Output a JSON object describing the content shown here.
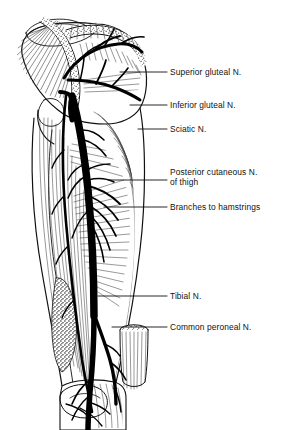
{
  "figure": {
    "view": "posterior",
    "background_color": "#ffffff",
    "ink_color": "#111111",
    "nerve_color": "#000000"
  },
  "labels": [
    {
      "id": "superior-gluteal",
      "text": "Superior gluteal N.",
      "line1": "Superior gluteal N.",
      "line2": "",
      "text_x": 170,
      "text_y": 72,
      "leader_x1": 152,
      "leader_x2": 167,
      "leader_y": 72,
      "anchor_x": 118,
      "anchor_y": 64
    },
    {
      "id": "inferior-gluteal",
      "text": "Inferior gluteal N.",
      "line1": "Inferior gluteal N.",
      "line2": "",
      "text_x": 170,
      "text_y": 105,
      "leader_x1": 152,
      "leader_x2": 167,
      "leader_y": 105,
      "anchor_x": 110,
      "anchor_y": 96
    },
    {
      "id": "sciatic",
      "text": "Sciatic N.",
      "line1": "Sciatic N.",
      "line2": "",
      "text_x": 170,
      "text_y": 129,
      "leader_x1": 152,
      "leader_x2": 167,
      "leader_y": 129,
      "anchor_x": 96,
      "anchor_y": 126
    },
    {
      "id": "posterior-cutaneous",
      "text": "Posterior cutaneous N. of thigh",
      "line1": "Posterior cutaneous N.",
      "line2": "of thigh",
      "text_x": 170,
      "text_y": 172,
      "leader_x1": 152,
      "leader_x2": 167,
      "leader_y": 180,
      "anchor_x": 100,
      "anchor_y": 180
    },
    {
      "id": "branches-hamstrings",
      "text": "Branches to hamstrings",
      "line1": "Branches to hamstrings",
      "line2": "",
      "text_x": 170,
      "text_y": 207,
      "leader_x1": 152,
      "leader_x2": 167,
      "leader_y": 207,
      "anchor_x": 104,
      "anchor_y": 207
    },
    {
      "id": "tibial",
      "text": "Tibial N.",
      "line1": "Tibial N.",
      "line2": "",
      "text_x": 170,
      "text_y": 296,
      "leader_x1": 152,
      "leader_x2": 167,
      "leader_y": 296,
      "anchor_x": 96,
      "anchor_y": 296
    },
    {
      "id": "common-peroneal",
      "text": "Common peroneal N.",
      "line1": "Common peroneal N.",
      "line2": "",
      "text_x": 170,
      "text_y": 327,
      "leader_x1": 152,
      "leader_x2": 167,
      "leader_y": 327,
      "anchor_x": 106,
      "anchor_y": 322
    }
  ],
  "structures": [
    {
      "id": "skin-flap",
      "name": "reflected skin flap",
      "region": "upper-left"
    },
    {
      "id": "gluteus-maximus-cut",
      "name": "gluteus maximus, cut and reflected",
      "region": "gluteal"
    },
    {
      "id": "hamstring-muscles",
      "name": "hamstring muscles",
      "region": "posterior thigh"
    },
    {
      "id": "popliteal-fat",
      "name": "popliteal fat (stippled)",
      "region": "popliteal fossa"
    },
    {
      "id": "cut-muscle-stump",
      "name": "cut muscle stump",
      "region": "lateral lower thigh"
    },
    {
      "id": "leg-stump",
      "name": "leg stump",
      "region": "below knee"
    }
  ]
}
